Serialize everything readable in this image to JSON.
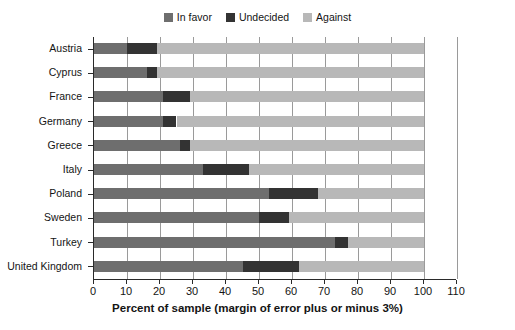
{
  "chart_data": {
    "type": "bar",
    "orientation": "horizontal",
    "stacked": true,
    "title": "",
    "xlabel": "Percent of sample (margin of error plus or minus 3%)",
    "ylabel": "",
    "xlim": [
      0,
      110
    ],
    "xticks": [
      "0",
      "10",
      "20",
      "30",
      "40",
      "50",
      "60",
      "70",
      "80",
      "90",
      "100",
      "110"
    ],
    "grid": "vertical",
    "legend_position": "top-center",
    "categories": [
      "Austria",
      "Cyprus",
      "France",
      "Germany",
      "Greece",
      "Italy",
      "Poland",
      "Sweden",
      "Turkey",
      "United Kingdom"
    ],
    "series": [
      {
        "name": "In favor",
        "color": "#6e6e6e",
        "values": [
          10,
          16,
          21,
          21,
          26,
          33,
          53,
          50,
          73,
          45
        ]
      },
      {
        "name": "Undecided",
        "color": "#333333",
        "values": [
          9,
          3,
          8,
          4,
          3,
          14,
          15,
          9,
          4,
          17
        ]
      },
      {
        "name": "Against",
        "color": "#b8b8b8",
        "values": [
          81,
          81,
          71,
          75,
          71,
          53,
          32,
          41,
          23,
          38
        ]
      }
    ]
  },
  "legend": {
    "items": [
      {
        "label": "In favor",
        "color": "#6e6e6e"
      },
      {
        "label": "Undecided",
        "color": "#333333"
      },
      {
        "label": "Against",
        "color": "#b8b8b8"
      }
    ]
  },
  "axis": {
    "x_title": "Percent of sample (margin of error plus or minus 3%)"
  },
  "colors": {
    "in_favor": "#6e6e6e",
    "undecided": "#333333",
    "against": "#b8b8b8",
    "gridline": "#9a9a9a",
    "axis": "#2a2a2a",
    "text": "#141414",
    "background": "#ffffff"
  }
}
